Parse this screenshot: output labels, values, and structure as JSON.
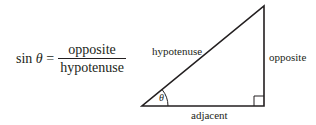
{
  "formula": {
    "lhs_func": "sin",
    "lhs_var": "θ",
    "equals": "=",
    "numerator": "opposite",
    "denominator": "hypotenuse"
  },
  "triangle": {
    "labels": {
      "hypotenuse": "hypotenuse",
      "opposite": "opposite",
      "adjacent": "adjacent",
      "angle": "θ"
    },
    "vertices": {
      "bottom_left": [
        142,
        106
      ],
      "bottom_right": [
        264,
        106
      ],
      "top": [
        264,
        6
      ]
    },
    "right_angle_marker": true,
    "stroke_color": "#231f20"
  }
}
